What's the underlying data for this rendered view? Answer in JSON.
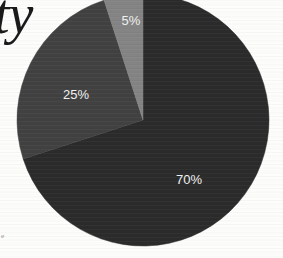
{
  "page": {
    "title_fragment": "ty",
    "caption_fragment": "e",
    "background_color": "#fdfdfc"
  },
  "chart_data": {
    "type": "pie",
    "title": "",
    "subtitle": "",
    "xlabel": "",
    "ylabel": "",
    "grid": false,
    "legend_position": "none",
    "labels_inside": true,
    "start_angle_deg": 0,
    "direction": "clockwise",
    "categories": [
      "70%",
      "25%",
      "5%"
    ],
    "values": [
      70,
      25,
      5
    ],
    "value_labels": [
      "70%",
      "25%",
      "5%"
    ],
    "colors": [
      "#2b2b2b",
      "#414141",
      "#848484"
    ],
    "label_color": "#f2f2f2",
    "geometry": {
      "center_x": 143,
      "center_y": 120,
      "radius": 126
    },
    "slices": [
      {
        "label": "70%",
        "value": 70,
        "color": "#2b2b2b",
        "start_deg": 0,
        "end_deg": 252,
        "label_x": 189,
        "label_y": 184
      },
      {
        "label": "25%",
        "value": 25,
        "color": "#414141",
        "start_deg": 252,
        "end_deg": 342,
        "label_x": 76,
        "label_y": 99
      },
      {
        "label": "5%",
        "value": 5,
        "color": "#848484",
        "start_deg": 342,
        "end_deg": 360,
        "label_x": 131,
        "label_y": 25
      }
    ]
  }
}
